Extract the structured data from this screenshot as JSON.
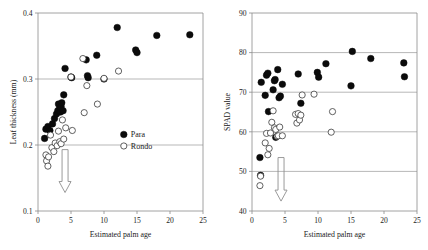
{
  "figure": {
    "panels": [
      "leaf-thickness",
      "spad-value"
    ]
  },
  "chart_data": [
    {
      "type": "scatter",
      "id": "leaf-thickness",
      "title": "",
      "xlabel": "Estimated palm age",
      "ylabel": "Leaf thickness (mm)",
      "xlim": [
        0,
        25
      ],
      "ylim": [
        0.1,
        0.4
      ],
      "xticks": [
        0,
        5,
        10,
        15,
        20,
        25
      ],
      "xticklabels": [
        "0",
        "5",
        "10",
        "15",
        "20",
        "25"
      ],
      "yticks": [
        0.1,
        0.2,
        0.3,
        0.4
      ],
      "yticklabels": [
        "0.1",
        "0.2",
        "0.3",
        "0.4"
      ],
      "grid": "horizontal-at-0.2-and-0.3",
      "legend_position": "lower-right-inside",
      "annotations": [
        {
          "type": "down-arrow",
          "x": 4.1,
          "y_from": 0.193,
          "y_to": 0.128
        }
      ],
      "series": [
        {
          "name": "Para",
          "marker": "filled-circle",
          "color": "#0b0b0b",
          "points": [
            [
              1.0,
              0.21
            ],
            [
              1.2,
              0.224
            ],
            [
              1.5,
              0.228
            ],
            [
              1.8,
              0.222
            ],
            [
              2.2,
              0.232
            ],
            [
              2.5,
              0.24
            ],
            [
              2.8,
              0.247
            ],
            [
              3.0,
              0.252
            ],
            [
              3.1,
              0.262
            ],
            [
              3.3,
              0.256
            ],
            [
              3.4,
              0.25
            ],
            [
              3.5,
              0.258
            ],
            [
              3.6,
              0.264
            ],
            [
              3.8,
              0.252
            ],
            [
              3.9,
              0.276
            ],
            [
              4.1,
              0.316
            ],
            [
              5.0,
              0.303
            ],
            [
              5.1,
              0.302
            ],
            [
              7.3,
              0.329
            ],
            [
              7.5,
              0.305
            ],
            [
              7.6,
              0.302
            ],
            [
              8.9,
              0.336
            ],
            [
              10.0,
              0.3
            ],
            [
              12.0,
              0.378
            ],
            [
              14.8,
              0.344
            ],
            [
              15.0,
              0.34
            ],
            [
              18.0,
              0.366
            ],
            [
              23.0,
              0.367
            ]
          ]
        },
        {
          "name": "Rondo",
          "marker": "open-circle",
          "color": "#ffffff",
          "points": [
            [
              1.2,
              0.185
            ],
            [
              1.3,
              0.176
            ],
            [
              1.5,
              0.168
            ],
            [
              1.6,
              0.182
            ],
            [
              1.9,
              0.215
            ],
            [
              2.1,
              0.196
            ],
            [
              2.4,
              0.19
            ],
            [
              2.6,
              0.203
            ],
            [
              2.9,
              0.199
            ],
            [
              3.1,
              0.221
            ],
            [
              3.3,
              0.205
            ],
            [
              3.5,
              0.202
            ],
            [
              3.7,
              0.238
            ],
            [
              3.9,
              0.209
            ],
            [
              4.2,
              0.226
            ],
            [
              5.0,
              0.303
            ],
            [
              5.2,
              0.222
            ],
            [
              6.8,
              0.331
            ],
            [
              7.0,
              0.249
            ],
            [
              7.4,
              0.29
            ],
            [
              9.0,
              0.262
            ],
            [
              10.0,
              0.301
            ],
            [
              12.2,
              0.312
            ]
          ]
        }
      ]
    },
    {
      "type": "scatter",
      "id": "spad-value",
      "title": "",
      "xlabel": "Estimated palm age",
      "ylabel": "SPAD value",
      "xlim": [
        0,
        25
      ],
      "ylim": [
        40,
        90
      ],
      "xticks": [
        0,
        5,
        10,
        15,
        20,
        25
      ],
      "xticklabels": [
        "0",
        "5",
        "10",
        "15",
        "20",
        "25"
      ],
      "yticks": [
        40,
        50,
        60,
        70,
        80,
        90
      ],
      "yticklabels": [
        "40",
        "50",
        "60",
        "70",
        "80",
        "90"
      ],
      "grid": "horizontal-at-50-60-70-80",
      "legend_position": "none",
      "annotations": [
        {
          "type": "down-arrow",
          "x": 4.4,
          "y_from": 53.5,
          "y_to": 42.5
        }
      ],
      "series": [
        {
          "name": "Para",
          "marker": "filled-circle",
          "color": "#0b0b0b",
          "points": [
            [
              1.2,
              53.5
            ],
            [
              1.3,
              49.0
            ],
            [
              1.4,
              72.5
            ],
            [
              2.0,
              69.2
            ],
            [
              2.2,
              74.3
            ],
            [
              2.4,
              74.8
            ],
            [
              2.5,
              65.1
            ],
            [
              3.2,
              70.6
            ],
            [
              3.4,
              72.9
            ],
            [
              3.5,
              73.2
            ],
            [
              3.6,
              58.6
            ],
            [
              3.9,
              75.7
            ],
            [
              4.1,
              68.6
            ],
            [
              4.3,
              69.0
            ],
            [
              4.6,
              72.0
            ],
            [
              7.0,
              74.6
            ],
            [
              7.4,
              67.2
            ],
            [
              9.9,
              75.0
            ],
            [
              10.1,
              73.8
            ],
            [
              11.2,
              77.2
            ],
            [
              15.0,
              71.6
            ],
            [
              15.2,
              80.3
            ],
            [
              18.0,
              78.5
            ],
            [
              23.0,
              77.4
            ],
            [
              23.1,
              73.9
            ]
          ]
        },
        {
          "name": "Rondo",
          "marker": "open-circle",
          "color": "#ffffff",
          "points": [
            [
              1.2,
              46.4
            ],
            [
              1.3,
              48.8
            ],
            [
              2.0,
              57.2
            ],
            [
              2.2,
              59.6
            ],
            [
              2.4,
              54.2
            ],
            [
              2.6,
              55.8
            ],
            [
              2.8,
              59.7
            ],
            [
              3.0,
              62.4
            ],
            [
              3.2,
              65.3
            ],
            [
              3.4,
              61.0
            ],
            [
              3.6,
              60.6
            ],
            [
              3.8,
              58.9
            ],
            [
              4.0,
              59.0
            ],
            [
              4.2,
              61.2
            ],
            [
              4.6,
              59.0
            ],
            [
              6.6,
              64.4
            ],
            [
              6.8,
              62.2
            ],
            [
              7.0,
              64.6
            ],
            [
              7.2,
              63.0
            ],
            [
              7.4,
              64.2
            ],
            [
              7.6,
              69.3
            ],
            [
              9.4,
              69.5
            ],
            [
              12.0,
              59.9
            ],
            [
              12.2,
              65.1
            ]
          ]
        }
      ]
    }
  ],
  "legend": {
    "entries": [
      {
        "label": "Para",
        "marker": "filled-circle"
      },
      {
        "label": "Rondo",
        "marker": "open-circle"
      }
    ]
  }
}
